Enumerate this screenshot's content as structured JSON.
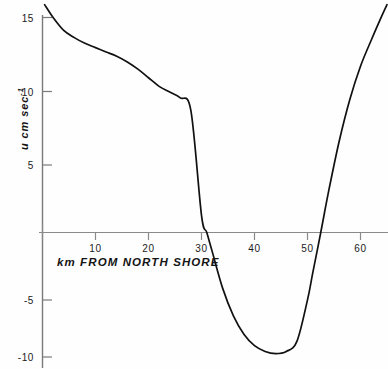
{
  "figure": {
    "background_color": "#fefefe",
    "curve_color": "#111111",
    "axis_color": "#6b6b6b"
  },
  "axes": {
    "x_title": "km FROM NORTH SHORE",
    "y_title_main": "u cm sec",
    "y_title_exponent": "-1",
    "x_ticks": [
      {
        "value": 10,
        "label": "10"
      },
      {
        "value": 20,
        "label": "20"
      },
      {
        "value": 30,
        "label": "30"
      },
      {
        "value": 40,
        "label": "40"
      },
      {
        "value": 50,
        "label": "50"
      },
      {
        "value": 60,
        "label": "60"
      }
    ],
    "y_ticks": [
      {
        "value": 15,
        "label": "15"
      },
      {
        "value": 10,
        "label": "10"
      },
      {
        "value": 5,
        "label": "5"
      },
      {
        "value": -5,
        "label": "-5"
      },
      {
        "value": -10,
        "label": "-10"
      }
    ]
  },
  "chart_data": {
    "type": "line",
    "title": "",
    "subtitle": "",
    "xlabel": "km FROM NORTH SHORE",
    "ylabel": "u cm sec-1",
    "xlim": [
      -0.4,
      65.5
    ],
    "ylim": [
      -11.2,
      16.5
    ],
    "grid": false,
    "legend": null,
    "annotations": [],
    "series": [
      {
        "name": "u velocity profile",
        "x": [
          0.4,
          2,
          4,
          6,
          8,
          10,
          12,
          14,
          16,
          18,
          20,
          22,
          24,
          26,
          28,
          30,
          31,
          32,
          34,
          36,
          38,
          40,
          42,
          44,
          46,
          48,
          50,
          51,
          52.5,
          54,
          56,
          58,
          60,
          62,
          64,
          65
        ],
        "y": [
          15.9,
          15.0,
          14.1,
          13.6,
          13.2,
          12.9,
          12.6,
          12.3,
          11.9,
          11.4,
          10.8,
          10.2,
          9.8,
          9.4,
          8.5,
          1.2,
          0.0,
          -1.3,
          -3.9,
          -5.8,
          -7.1,
          -7.9,
          -8.3,
          -8.45,
          -8.3,
          -7.6,
          -4.7,
          -2.8,
          0.0,
          2.9,
          6.4,
          9.3,
          11.6,
          13.4,
          15.1,
          15.9
        ]
      }
    ],
    "zero_crossings": [
      31.0,
      52.5
    ],
    "minimum": {
      "x": 44.0,
      "y": -8.45
    }
  }
}
